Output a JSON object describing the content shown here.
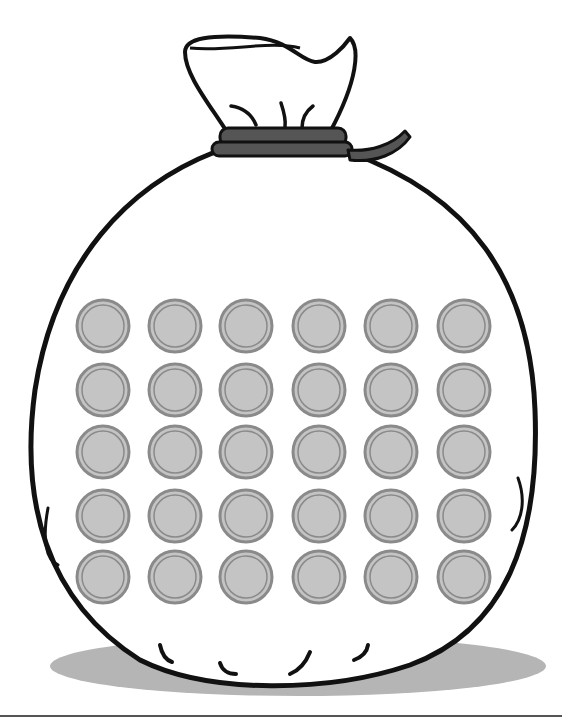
{
  "illustration": {
    "subject": "money bag with coins",
    "coin_grid": {
      "rows": 5,
      "columns": 6,
      "total": 30
    },
    "coin_columns_x": [
      103,
      175,
      246,
      319,
      391,
      464
    ],
    "coin_rows_y": [
      326,
      390,
      452,
      516,
      577
    ],
    "coin_radius": 26,
    "colors": {
      "outline": "#111111",
      "tie_band": "#555555",
      "coin_fill": "#c4c4c4",
      "coin_rim": "#8a8a8a",
      "shadow": "#b5b5b5",
      "bottom_rule": "#555555"
    }
  }
}
